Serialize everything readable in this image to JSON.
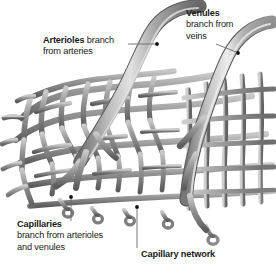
{
  "figure": {
    "background_color": "#ffffff",
    "text_color": "#1a1a1a",
    "vessel_colors": {
      "mid_gray": "#8a8a8a",
      "highlight": "#d8d8d8",
      "shadow": "#4f4f4f",
      "outline": "#6e6e6e"
    }
  },
  "labels": {
    "arterioles": {
      "line1_bold": "Arterioles",
      "line1_rest": " branch",
      "line2": "from arteries"
    },
    "venules": {
      "line1_bold": "Venules",
      "line2": "branch from",
      "line3": "veins"
    },
    "capillaries": {
      "line1_bold": "Capillaries",
      "line2": "branch from arterioles",
      "line3": "and venules"
    },
    "capillary_network": {
      "line1_bold": "Capillary network"
    }
  }
}
